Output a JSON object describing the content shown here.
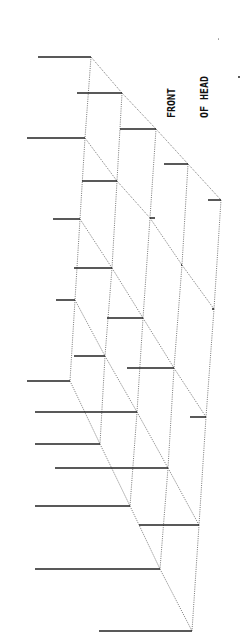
{
  "figure": {
    "label_line1": "FRONT",
    "label_line2": "OF HEAD",
    "orientation": "rotated -90deg",
    "grid": {
      "columns": 5,
      "rows": 5,
      "nodes": [
        [
          [
            91,
            57
          ],
          [
            122,
            93
          ],
          [
            156,
            129
          ],
          [
            188,
            164
          ],
          [
            221,
            200
          ]
        ],
        [
          [
            85,
            138
          ],
          [
            117,
            181
          ],
          [
            150,
            218
          ],
          [
            182,
            265
          ],
          [
            214,
            309
          ]
        ],
        [
          [
            80,
            219
          ],
          [
            112,
            268
          ],
          [
            143,
            318
          ],
          [
            174,
            368
          ],
          [
            206,
            417
          ]
        ],
        [
          [
            75,
            300
          ],
          [
            105,
            356
          ],
          [
            137,
            412
          ],
          [
            168,
            468
          ],
          [
            199,
            525
          ]
        ],
        [
          [
            70,
            381
          ],
          [
            100,
            444
          ],
          [
            130,
            506
          ],
          [
            160,
            569
          ],
          [
            192,
            631
          ]
        ]
      ],
      "spike_left_x": [
        [
          38,
          77,
          120,
          164,
          208
        ],
        [
          27,
          82,
          155,
          181,
          212
        ],
        [
          53,
          74,
          107,
          127,
          190
        ],
        [
          56,
          74,
          35,
          55,
          139
        ],
        [
          27,
          35,
          35,
          35,
          99
        ]
      ]
    },
    "colors": {
      "grid": "#555555",
      "spike": "#222222",
      "background": "#ffffff"
    }
  }
}
